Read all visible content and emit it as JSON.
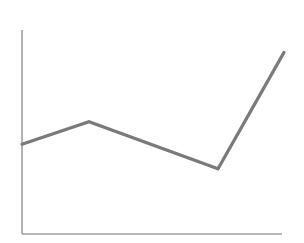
{
  "chart_data": {
    "type": "line",
    "title": "",
    "xlabel": "",
    "ylabel": "",
    "grid": false,
    "legend": null,
    "x": [
      0,
      1,
      2,
      3
    ],
    "categories": [
      "",
      "",
      "",
      ""
    ],
    "series": [
      {
        "name": "",
        "values": [
          44,
          55,
          32,
          89
        ]
      }
    ],
    "ylim": [
      0,
      100
    ],
    "xlim": [
      0,
      3
    ]
  },
  "style": {
    "line_color": "#7a7a7a",
    "axis_color": "#a0a0a0",
    "background": "#ffffff"
  },
  "layout": {
    "plot": {
      "x0": 22,
      "y0": 234,
      "x1": 284,
      "y_top": 30
    },
    "x_positions": [
      22,
      89,
      218,
      284
    ]
  }
}
